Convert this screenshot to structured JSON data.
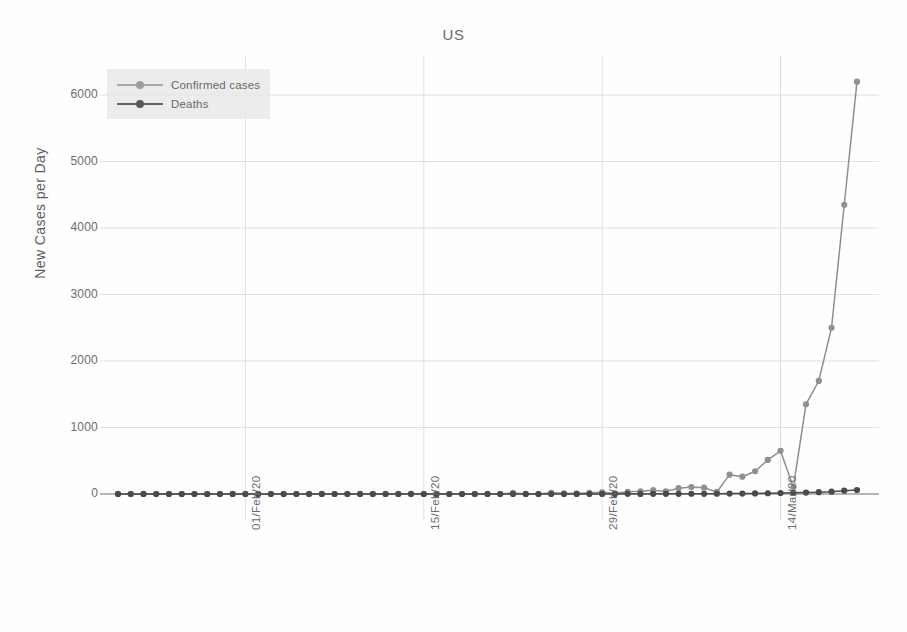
{
  "chart_data": {
    "type": "line",
    "title": "US",
    "xlabel": "",
    "ylabel": "New Cases per Day",
    "ylim": [
      0,
      6500
    ],
    "yticks": [
      0,
      1000,
      2000,
      3000,
      4000,
      5000,
      6000
    ],
    "ytick_labels": [
      "0",
      "1000",
      "2000",
      "3000",
      "4000",
      "5000",
      "6000"
    ],
    "xtick_labels": [
      "01/Feb/20",
      "15/Feb/20",
      "29/Feb/20",
      "14/Mar/20"
    ],
    "xtick_indices": [
      10,
      24,
      38,
      52
    ],
    "grid": true,
    "legend_position": "upper-left",
    "x": [
      "22/Jan/20",
      "23/Jan/20",
      "24/Jan/20",
      "25/Jan/20",
      "26/Jan/20",
      "27/Jan/20",
      "28/Jan/20",
      "29/Jan/20",
      "30/Jan/20",
      "31/Jan/20",
      "01/Feb/20",
      "02/Feb/20",
      "03/Feb/20",
      "04/Feb/20",
      "05/Feb/20",
      "06/Feb/20",
      "07/Feb/20",
      "08/Feb/20",
      "09/Feb/20",
      "10/Feb/20",
      "11/Feb/20",
      "12/Feb/20",
      "13/Feb/20",
      "14/Feb/20",
      "15/Feb/20",
      "16/Feb/20",
      "17/Feb/20",
      "18/Feb/20",
      "19/Feb/20",
      "20/Feb/20",
      "21/Feb/20",
      "22/Feb/20",
      "23/Feb/20",
      "24/Feb/20",
      "25/Feb/20",
      "26/Feb/20",
      "27/Feb/20",
      "28/Feb/20",
      "29/Feb/20",
      "01/Mar/20",
      "02/Mar/20",
      "03/Mar/20",
      "04/Mar/20",
      "05/Mar/20",
      "06/Mar/20",
      "07/Mar/20",
      "08/Mar/20",
      "09/Mar/20",
      "10/Mar/20",
      "11/Mar/20",
      "12/Mar/20",
      "13/Mar/20",
      "14/Mar/20",
      "15/Mar/20",
      "16/Mar/20",
      "17/Mar/20",
      "18/Mar/20",
      "19/Mar/20",
      "20/Mar/20"
    ],
    "series": [
      {
        "name": "Confirmed cases",
        "color": "#8f8f8f",
        "values": [
          1,
          0,
          1,
          0,
          3,
          0,
          0,
          0,
          0,
          1,
          1,
          0,
          3,
          0,
          0,
          0,
          1,
          0,
          0,
          1,
          0,
          1,
          1,
          2,
          0,
          0,
          0,
          0,
          0,
          1,
          0,
          16,
          1,
          0,
          18,
          11,
          6,
          19,
          25,
          10,
          33,
          41,
          57,
          39,
          87,
          105,
          95,
          31,
          291,
          260,
          342,
          512,
          650,
          100,
          1350,
          1700,
          2500,
          4350,
          6200
        ]
      },
      {
        "name": "Deaths",
        "color": "#4a4a4a",
        "values": [
          0,
          0,
          0,
          0,
          0,
          0,
          0,
          0,
          0,
          0,
          0,
          0,
          0,
          0,
          0,
          0,
          0,
          0,
          0,
          0,
          0,
          0,
          0,
          0,
          0,
          0,
          0,
          0,
          0,
          0,
          0,
          0,
          0,
          0,
          0,
          0,
          1,
          0,
          1,
          1,
          2,
          1,
          2,
          2,
          3,
          4,
          3,
          4,
          6,
          7,
          9,
          11,
          15,
          18,
          22,
          28,
          35,
          50,
          60
        ]
      }
    ]
  },
  "legend": {
    "items": [
      {
        "label": "Confirmed cases"
      },
      {
        "label": "Deaths"
      }
    ]
  },
  "colors": {
    "confirmed": "#8f8f8f",
    "deaths": "#4a4a4a",
    "grid": "#d8d8d8",
    "text": "#6b6b6d",
    "legend_bg": "#e9e9e9"
  }
}
